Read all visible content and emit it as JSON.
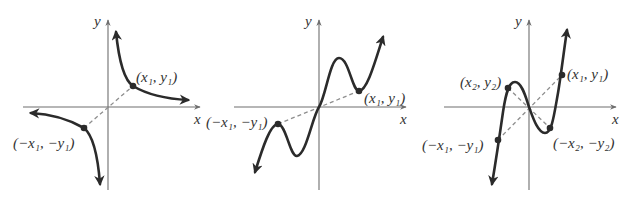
{
  "figures": [
    {
      "id": "odd-hyperbola",
      "axis_labels": {
        "x": "x",
        "y": "y"
      },
      "points": [
        {
          "label": "(x₁, y₁)"
        },
        {
          "label": "(−x₁, −y₁)"
        }
      ]
    },
    {
      "id": "odd-wavy-curve",
      "axis_labels": {
        "x": "x",
        "y": "y"
      },
      "points": [
        {
          "label": "(x₁, y₁)"
        },
        {
          "label": "(−x₁, −y₁)"
        }
      ]
    },
    {
      "id": "odd-cubic",
      "axis_labels": {
        "x": "x",
        "y": "y"
      },
      "points": [
        {
          "label": "(x₁, y₁)"
        },
        {
          "label": "(−x₁, −y₁)"
        },
        {
          "label": "(x₂, y₂)"
        },
        {
          "label": "(−x₂, −y₂)"
        }
      ]
    }
  ],
  "colors": {
    "curve": "#2b2b2b",
    "axis": "#6e6e6e",
    "dashed": "#8e8e8e"
  }
}
